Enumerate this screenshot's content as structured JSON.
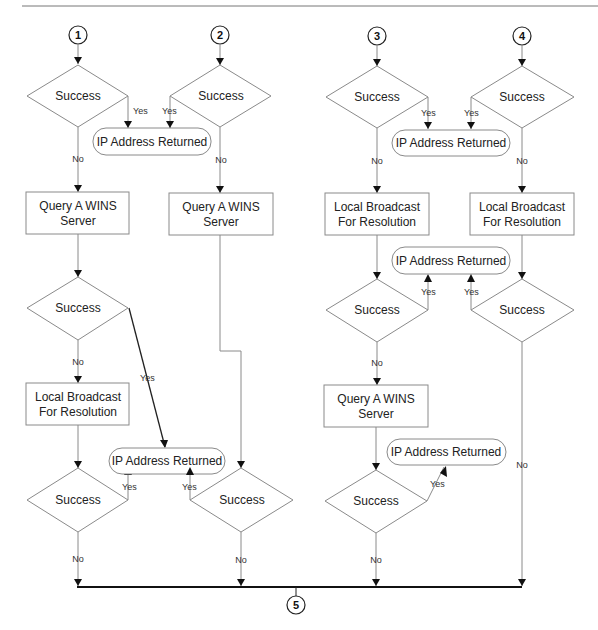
{
  "diagram": {
    "connectors": [
      "1",
      "2",
      "3",
      "4",
      "5"
    ],
    "decision_label": "Success",
    "yes_label": "Yes",
    "no_label": "No",
    "result_label": "IP Address Returned",
    "process_wins": [
      "Query A WINS",
      "Server"
    ],
    "process_broadcast": [
      "Local Broadcast",
      "For Resolution"
    ],
    "columns": [
      {
        "start": "1",
        "steps": [
          "Success",
          "Query A WINS Server",
          "Success",
          "Local Broadcast For Resolution",
          "Success"
        ]
      },
      {
        "start": "2",
        "steps": [
          "Success",
          "Query A WINS Server",
          "Success"
        ]
      },
      {
        "start": "3",
        "steps": [
          "Success",
          "Local Broadcast For Resolution",
          "Success",
          "Query A WINS Server",
          "Success"
        ]
      },
      {
        "start": "4",
        "steps": [
          "Success",
          "Local Broadcast For Resolution",
          "Success"
        ]
      }
    ],
    "end": "5"
  }
}
